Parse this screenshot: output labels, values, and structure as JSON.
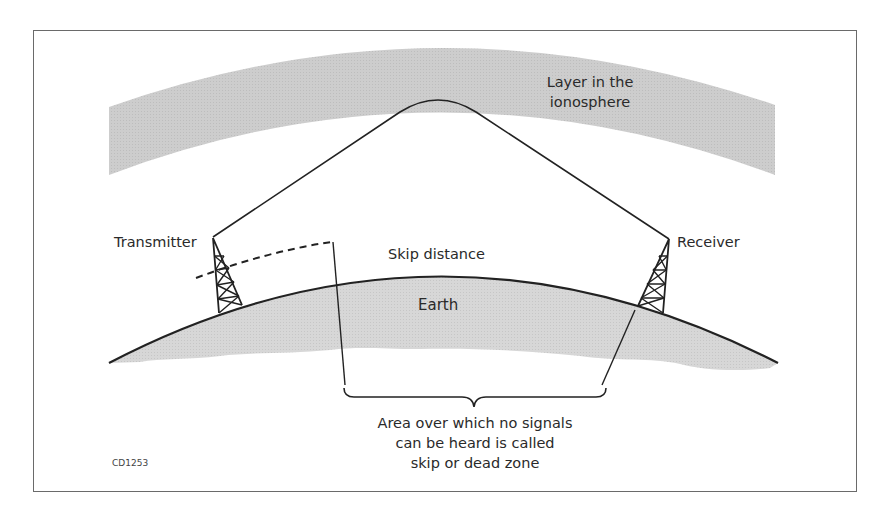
{
  "diagram": {
    "type": "skywave-propagation-illustration",
    "labels": {
      "ionosphere_layer_line1": "Layer in the",
      "ionosphere_layer_line2": "ionosphere",
      "transmitter": "Transmitter",
      "receiver": "Receiver",
      "skip_distance": "Skip distance",
      "earth": "Earth",
      "dead_zone_line1": "Area over which no signals",
      "dead_zone_line2": "can be heard is called",
      "dead_zone_line3": "skip or dead zone",
      "figure_code": "CD1253"
    },
    "colors": {
      "background": "#ffffff",
      "frame_border": "#6a6a6a",
      "ionosphere_fill": "#cfcfcf",
      "earth_fill": "#d6d6d6",
      "stroke": "#222222",
      "text": "#2a2a2a"
    },
    "elements": [
      {
        "id": "ionosphere-layer",
        "kind": "curved-band"
      },
      {
        "id": "earth-surface",
        "kind": "arc-with-fill"
      },
      {
        "id": "transmitter-tower",
        "kind": "lattice-tower"
      },
      {
        "id": "receiver-tower",
        "kind": "lattice-tower"
      },
      {
        "id": "sky-wave-path",
        "kind": "reflected-ray",
        "from": "transmitter-tower",
        "via": "ionosphere-layer",
        "to": "receiver-tower"
      },
      {
        "id": "ground-wave-path",
        "kind": "dashed-line",
        "from": "transmitter-tower"
      },
      {
        "id": "dead-zone-brace",
        "kind": "curly-brace"
      }
    ]
  }
}
